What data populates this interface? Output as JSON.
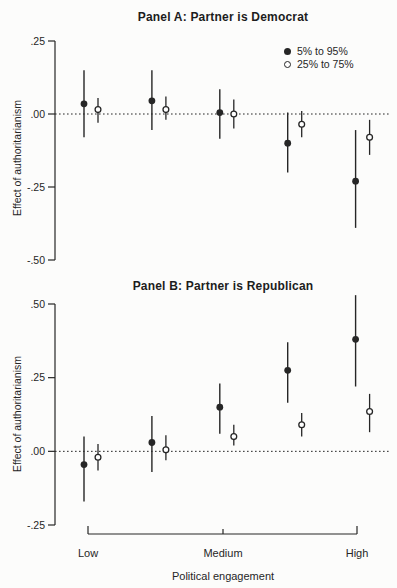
{
  "chart_data": {
    "type": "scatter",
    "xlabel": "Political engagement",
    "ylabel": "Effect of authoritarianism",
    "x_tick_labels": [
      "Low",
      "Medium",
      "High"
    ],
    "x_positions": [
      1,
      2,
      3,
      4,
      5
    ],
    "x_tick_positions": [
      1,
      3,
      5
    ],
    "legend_position": "top-right-panel-a",
    "grid": false,
    "colors": {
      "ink": "#262626",
      "background": "#fcfcfb"
    },
    "legend": [
      {
        "label": "5% to 95%",
        "marker": "filled"
      },
      {
        "label": "25% to 75%",
        "marker": "open"
      }
    ],
    "panels": [
      {
        "title": "Panel A: Partner is Democrat",
        "ylim": [
          -0.5,
          0.25
        ],
        "zero_line": true,
        "yticks": [
          {
            "v": 0.25,
            "label": ".25"
          },
          {
            "v": 0.0,
            "label": ".00"
          },
          {
            "v": -0.25,
            "label": "-.25"
          },
          {
            "v": -0.5,
            "label": "-.50"
          }
        ],
        "series": [
          {
            "name": "5% to 95%",
            "marker": "filled",
            "points": [
              {
                "x": 1,
                "est": 0.035,
                "lo": -0.08,
                "hi": 0.15
              },
              {
                "x": 2,
                "est": 0.045,
                "lo": -0.055,
                "hi": 0.15
              },
              {
                "x": 3,
                "est": 0.005,
                "lo": -0.085,
                "hi": 0.085
              },
              {
                "x": 4,
                "est": -0.1,
                "lo": -0.2,
                "hi": 0.005
              },
              {
                "x": 5,
                "est": -0.23,
                "lo": -0.39,
                "hi": -0.055
              }
            ]
          },
          {
            "name": "25% to 75%",
            "marker": "open",
            "points": [
              {
                "x": 1,
                "est": 0.015,
                "lo": -0.03,
                "hi": 0.055
              },
              {
                "x": 2,
                "est": 0.015,
                "lo": -0.02,
                "hi": 0.06
              },
              {
                "x": 3,
                "est": 0.0,
                "lo": -0.05,
                "hi": 0.05
              },
              {
                "x": 4,
                "est": -0.035,
                "lo": -0.08,
                "hi": 0.01
              },
              {
                "x": 5,
                "est": -0.08,
                "lo": -0.14,
                "hi": -0.02
              }
            ]
          }
        ]
      },
      {
        "title": "Panel B: Partner is Republican",
        "ylim": [
          -0.25,
          0.5
        ],
        "zero_line": true,
        "yticks": [
          {
            "v": 0.5,
            "label": ".50"
          },
          {
            "v": 0.25,
            "label": ".25"
          },
          {
            "v": 0.0,
            "label": ".00"
          },
          {
            "v": -0.25,
            "label": "-.25"
          }
        ],
        "series": [
          {
            "name": "5% to 95%",
            "marker": "filled",
            "points": [
              {
                "x": 1,
                "est": -0.045,
                "lo": -0.17,
                "hi": 0.05
              },
              {
                "x": 2,
                "est": 0.03,
                "lo": -0.07,
                "hi": 0.12
              },
              {
                "x": 3,
                "est": 0.15,
                "lo": 0.06,
                "hi": 0.23
              },
              {
                "x": 4,
                "est": 0.275,
                "lo": 0.165,
                "hi": 0.37
              },
              {
                "x": 5,
                "est": 0.38,
                "lo": 0.22,
                "hi": 0.53
              }
            ]
          },
          {
            "name": "25% to 75%",
            "marker": "open",
            "points": [
              {
                "x": 1,
                "est": -0.02,
                "lo": -0.065,
                "hi": 0.025
              },
              {
                "x": 2,
                "est": 0.005,
                "lo": -0.03,
                "hi": 0.055
              },
              {
                "x": 3,
                "est": 0.05,
                "lo": 0.02,
                "hi": 0.09
              },
              {
                "x": 4,
                "est": 0.09,
                "lo": 0.05,
                "hi": 0.13
              },
              {
                "x": 5,
                "est": 0.135,
                "lo": 0.065,
                "hi": 0.195
              }
            ]
          }
        ]
      }
    ]
  }
}
